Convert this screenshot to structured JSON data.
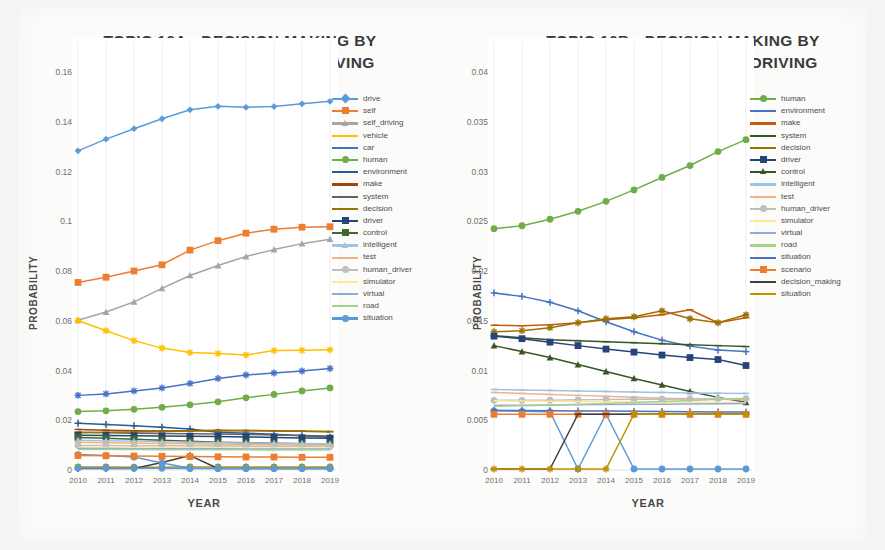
{
  "meta": {
    "background_color": "#f4f4f3",
    "panel_color": "#ffffff",
    "axis_text_color": "#6f6f6f",
    "title_color": "#3a3a3a"
  },
  "chart_data": [
    {
      "id": "topic-16a",
      "type": "line",
      "title": "TOPIC 16A - DECISION MAKING BY HUMAN_DRIVER IN SELF-DRIVING CARS",
      "title_lines": [
        "TOPIC 16A - DECISION MAKING BY",
        "HUMAN_DRIVER IN SELF-DRIVING",
        "CARS"
      ],
      "xlabel": "YEAR",
      "ylabel": "PROBABILITY",
      "x": [
        2010,
        2011,
        2012,
        2013,
        2014,
        2015,
        2016,
        2017,
        2018,
        2019
      ],
      "xtick_labels": [
        "2010",
        "2011",
        "2012",
        "2013",
        "2014",
        "2015",
        "2016",
        "2017",
        "2018",
        "2019"
      ],
      "ytick_labels": [
        "0",
        "0.02",
        "0.04",
        "0.06",
        "0.08",
        "0.1",
        "0.12",
        "0.14",
        "0.16"
      ],
      "ylim": [
        0,
        0.16
      ],
      "yticks": [
        0,
        0.02,
        0.04,
        0.06,
        0.08,
        0.1,
        0.12,
        0.14,
        0.16
      ],
      "grid": true,
      "legend_position": "right",
      "series": [
        {
          "name": "drive",
          "color": "#5b9bd5",
          "marker": "diamond",
          "values": [
            0.1283,
            0.133,
            0.1372,
            0.1412,
            0.1448,
            0.1462,
            0.1458,
            0.1461,
            0.1472,
            0.1482
          ]
        },
        {
          "name": "self",
          "color": "#ed7d31",
          "marker": "square",
          "values": [
            0.0754,
            0.0775,
            0.08,
            0.0825,
            0.0884,
            0.0922,
            0.0952,
            0.0968,
            0.0976,
            0.0978
          ]
        },
        {
          "name": "self_driving",
          "color": "#a5a5a5",
          "marker": "triangle",
          "values": [
            0.0602,
            0.0635,
            0.0676,
            0.073,
            0.0782,
            0.0822,
            0.0858,
            0.0886,
            0.091,
            0.0928
          ]
        },
        {
          "name": "vehicle",
          "color": "#ffc000",
          "marker": "cross",
          "values": [
            0.0601,
            0.056,
            0.052,
            0.049,
            0.0472,
            0.0468,
            0.0462,
            0.048,
            0.0481,
            0.0483
          ]
        },
        {
          "name": "car",
          "color": "#4472c4",
          "marker": "star",
          "values": [
            0.03,
            0.0306,
            0.0318,
            0.033,
            0.0348,
            0.0368,
            0.0382,
            0.039,
            0.0398,
            0.0408
          ]
        },
        {
          "name": "human",
          "color": "#70ad47",
          "marker": "circle",
          "values": [
            0.0235,
            0.0238,
            0.0244,
            0.0252,
            0.0262,
            0.0274,
            0.029,
            0.0304,
            0.0318,
            0.033
          ]
        },
        {
          "name": "environment",
          "color": "#255e91",
          "marker": "plus",
          "values": [
            0.0188,
            0.0183,
            0.0178,
            0.0172,
            0.0165,
            0.0152,
            0.0148,
            0.0144,
            0.0138,
            0.0132
          ]
        },
        {
          "name": "make",
          "color": "#9e480e",
          "marker": "dash",
          "values": [
            0.0163,
            0.016,
            0.0158,
            0.0157,
            0.0158,
            0.016,
            0.0159,
            0.0158,
            0.0156,
            0.0154
          ]
        },
        {
          "name": "system",
          "color": "#636363",
          "marker": "dash",
          "values": [
            0.0152,
            0.015,
            0.0148,
            0.0147,
            0.0146,
            0.0145,
            0.0143,
            0.0141,
            0.0139,
            0.0137
          ]
        },
        {
          "name": "decision",
          "color": "#997300",
          "marker": "dash",
          "values": [
            0.015,
            0.0152,
            0.0153,
            0.0155,
            0.0157,
            0.0158,
            0.0158,
            0.0157,
            0.0156,
            0.0155
          ]
        },
        {
          "name": "driver",
          "color": "#264478",
          "marker": "square",
          "values": [
            0.014,
            0.0139,
            0.0138,
            0.0137,
            0.0136,
            0.0135,
            0.0133,
            0.0131,
            0.0129,
            0.0128
          ]
        },
        {
          "name": "control",
          "color": "#43682b",
          "marker": "square",
          "values": [
            0.0131,
            0.0128,
            0.0124,
            0.012,
            0.0116,
            0.0112,
            0.011,
            0.0108,
            0.0106,
            0.0105
          ]
        },
        {
          "name": "intelligent",
          "color": "#9dc3e6",
          "marker": "triangle",
          "values": [
            0.012,
            0.0118,
            0.0116,
            0.0114,
            0.0112,
            0.011,
            0.0109,
            0.0108,
            0.0107,
            0.0106
          ]
        },
        {
          "name": "test",
          "color": "#f4b183",
          "marker": "dash",
          "values": [
            0.0112,
            0.011,
            0.0108,
            0.0107,
            0.0106,
            0.0104,
            0.0103,
            0.0102,
            0.0101,
            0.01
          ]
        },
        {
          "name": "human_driver",
          "color": "#bfbfbf",
          "marker": "circle",
          "values": [
            0.0098,
            0.0098,
            0.0097,
            0.0097,
            0.0097,
            0.0096,
            0.0096,
            0.0095,
            0.0095,
            0.0094
          ]
        },
        {
          "name": "simulator",
          "color": "#ffe699",
          "marker": "line",
          "values": [
            0.009,
            0.009,
            0.0089,
            0.0089,
            0.0089,
            0.0089,
            0.0088,
            0.0088,
            0.0088,
            0.0088
          ]
        },
        {
          "name": "virtual",
          "color": "#8faadc",
          "marker": "line",
          "values": [
            0.0086,
            0.0086,
            0.0085,
            0.0085,
            0.0085,
            0.0085,
            0.0084,
            0.0084,
            0.0084,
            0.0084
          ]
        },
        {
          "name": "road",
          "color": "#a9d18e",
          "marker": "line",
          "values": [
            0.0082,
            0.0082,
            0.0082,
            0.0081,
            0.0081,
            0.0081,
            0.0081,
            0.008,
            0.008,
            0.008
          ]
        },
        {
          "name": "situation",
          "color": "#5b9bd5",
          "marker": "circle",
          "values": [
            0.0008,
            0.0008,
            0.0007,
            0.0007,
            0.0006,
            0.0006,
            0.0006,
            0.0006,
            0.0006,
            0.0006
          ]
        }
      ],
      "extra_series": [
        {
          "name": "low-gold",
          "color": "#bf9000",
          "marker": "circle",
          "values": [
            0.0012,
            0.0012,
            0.0011,
            0.0011,
            0.0012,
            0.0012,
            0.0012,
            0.0012,
            0.0012,
            0.0012
          ]
        },
        {
          "name": "low-cross-dark",
          "color": "#3f3f3f",
          "marker": "plus",
          "values": [
            0.0006,
            0.0006,
            0.0006,
            0.003,
            0.0058,
            0.0006,
            0.0006,
            0.0006,
            0.0006,
            0.0006
          ]
        },
        {
          "name": "low-cross-blue",
          "color": "#5b9bd5",
          "marker": "circle",
          "values": [
            0.0062,
            0.0058,
            0.0052,
            0.0028,
            0.0007,
            0.0006,
            0.0006,
            0.0006,
            0.0006,
            0.0006
          ]
        },
        {
          "name": "low-orange",
          "color": "#ed7d31",
          "marker": "square",
          "values": [
            0.0058,
            0.0057,
            0.0056,
            0.0055,
            0.0054,
            0.0053,
            0.0052,
            0.0052,
            0.0051,
            0.0051
          ]
        }
      ]
    },
    {
      "id": "topic-16b",
      "type": "line",
      "title": "TOPIC 16B - DECISION MAKING BY HUMAN_DRIVER IN SELF-DRIVING CARS",
      "title_lines": [
        "TOPIC 16B - DECISION MAKING BY",
        "HUMAN_DRIVER IN SELF-DRIVING",
        "CARS"
      ],
      "xlabel": "YEAR",
      "ylabel": "PROBABILITY",
      "x": [
        2010,
        2011,
        2012,
        2013,
        2014,
        2015,
        2016,
        2017,
        2018,
        2019
      ],
      "xtick_labels": [
        "2010",
        "2011",
        "2012",
        "2013",
        "2014",
        "2015",
        "2016",
        "2017",
        "2018",
        "2019"
      ],
      "ytick_labels": [
        "0",
        "0.005",
        "0.01",
        "0.015",
        "0.02",
        "0.025",
        "0.03",
        "0.035",
        "0.04"
      ],
      "ylim": [
        0,
        0.04
      ],
      "yticks": [
        0,
        0.005,
        0.01,
        0.015,
        0.02,
        0.025,
        0.03,
        0.035,
        0.04
      ],
      "grid": true,
      "legend_position": "right",
      "series": [
        {
          "name": "human",
          "color": "#70ad47",
          "marker": "circle",
          "values": [
            0.02425,
            0.02455,
            0.0252,
            0.026,
            0.027,
            0.02815,
            0.0294,
            0.0306,
            0.032,
            0.0332
          ]
        },
        {
          "name": "environment",
          "color": "#4472c4",
          "marker": "plus",
          "values": [
            0.0178,
            0.01745,
            0.01685,
            0.016,
            0.0149,
            0.0139,
            0.01305,
            0.01245,
            0.01205,
            0.0119
          ]
        },
        {
          "name": "make",
          "color": "#c55a11",
          "marker": "dash",
          "values": [
            0.01455,
            0.0145,
            0.0146,
            0.0148,
            0.0151,
            0.0153,
            0.0156,
            0.0161,
            0.0148,
            0.0153
          ]
        },
        {
          "name": "system",
          "color": "#375623",
          "marker": "dash",
          "values": [
            0.0135,
            0.0133,
            0.0131,
            0.013,
            0.0129,
            0.0128,
            0.0127,
            0.0126,
            0.0125,
            0.0124
          ]
        },
        {
          "name": "decision",
          "color": "#997300",
          "marker": "cross",
          "values": [
            0.0139,
            0.014,
            0.0143,
            0.0148,
            0.0152,
            0.0154,
            0.016,
            0.0152,
            0.0148,
            0.0156
          ]
        },
        {
          "name": "driver",
          "color": "#264478",
          "marker": "square",
          "values": [
            0.01345,
            0.0132,
            0.01285,
            0.0125,
            0.01215,
            0.01185,
            0.01155,
            0.0113,
            0.0111,
            0.0105
          ]
        },
        {
          "name": "control",
          "color": "#375623",
          "marker": "triangle",
          "values": [
            0.0125,
            0.0119,
            0.0113,
            0.0106,
            0.0099,
            0.0092,
            0.00855,
            0.0079,
            0.0073,
            0.0068
          ]
        },
        {
          "name": "intelligent",
          "color": "#9dc3e6",
          "marker": "dash",
          "values": [
            0.0081,
            0.00805,
            0.008,
            0.00795,
            0.0079,
            0.00785,
            0.0078,
            0.00775,
            0.00772,
            0.0077
          ]
        },
        {
          "name": "test",
          "color": "#f4b183",
          "marker": "dash",
          "values": [
            0.0078,
            0.0077,
            0.0076,
            0.0075,
            0.0074,
            0.0073,
            0.00722,
            0.00715,
            0.0071,
            0.00705
          ]
        },
        {
          "name": "human_driver",
          "color": "#bfbfbf",
          "marker": "circle",
          "values": [
            0.007,
            0.007,
            0.00702,
            0.00705,
            0.00708,
            0.0071,
            0.00712,
            0.00714,
            0.00716,
            0.00718
          ]
        },
        {
          "name": "simulator",
          "color": "#ffe699",
          "marker": "line",
          "values": [
            0.00695,
            0.00693,
            0.0069,
            0.00688,
            0.00686,
            0.00684,
            0.00682,
            0.0068,
            0.00678,
            0.00676
          ]
        },
        {
          "name": "virtual",
          "color": "#8faadc",
          "marker": "line",
          "values": [
            0.0065,
            0.00652,
            0.00654,
            0.00656,
            0.00658,
            0.0066,
            0.00662,
            0.00664,
            0.00666,
            0.00668
          ]
        },
        {
          "name": "road",
          "color": "#a9d18e",
          "marker": "line",
          "values": [
            0.0064,
            0.00645,
            0.00652,
            0.0066,
            0.00668,
            0.00678,
            0.00688,
            0.00698,
            0.00708,
            0.00718
          ]
        },
        {
          "name": "situation",
          "color": "#4472c4",
          "marker": "plus",
          "values": [
            0.006,
            0.00598,
            0.00596,
            0.00594,
            0.00592,
            0.0059,
            0.00588,
            0.00586,
            0.00584,
            0.00582
          ]
        },
        {
          "name": "scenario",
          "color": "#ed7d31",
          "marker": "square",
          "values": [
            0.0056,
            0.0056,
            0.0056,
            0.0056,
            0.0056,
            0.0056,
            0.0056,
            0.0056,
            0.0056,
            0.0056
          ]
        },
        {
          "name": "decision_making",
          "color": "#3f3f3f",
          "marker": "dash",
          "values": [
            0.0001,
            0.0001,
            0.0001,
            0.0056,
            0.0056,
            0.0056,
            0.0056,
            0.0056,
            0.0056,
            0.0056
          ]
        },
        {
          "name": "situation",
          "color": "#bf9000",
          "marker": "cross",
          "values": [
            0.0001,
            0.0001,
            0.0001,
            0.0001,
            0.0001,
            0.0056,
            0.0056,
            0.0056,
            0.0056,
            0.0056
          ]
        }
      ],
      "extra_series": [
        {
          "name": "cross-blue",
          "color": "#5b9bd5",
          "marker": "circle",
          "values": [
            0.00595,
            0.0059,
            0.00585,
            0.0001,
            0.0056,
            0.0001,
            0.0001,
            0.0001,
            0.0001,
            0.0001
          ]
        }
      ]
    }
  ]
}
